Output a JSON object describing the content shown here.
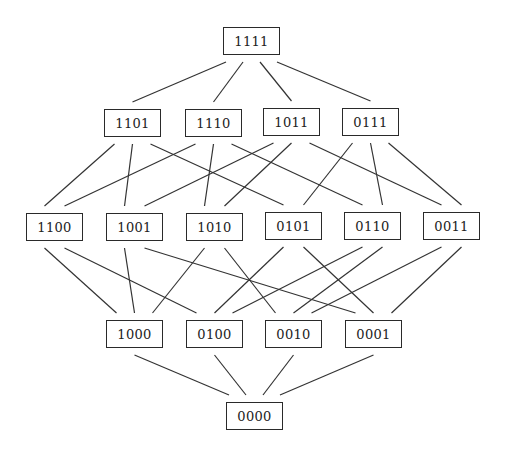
{
  "diagram": {
    "title": "",
    "type": "hasse-diagram",
    "line_color": "#333333",
    "box_width": 57,
    "box_height": 28,
    "levels": [
      {
        "nodes": [
          {
            "label": "1111",
            "x": 223,
            "y": 27
          }
        ]
      },
      {
        "nodes": [
          {
            "label": "1101",
            "x": 104,
            "y": 109
          },
          {
            "label": "1110",
            "x": 185,
            "y": 109
          },
          {
            "label": "1011",
            "x": 263,
            "y": 108
          },
          {
            "label": "0111",
            "x": 342,
            "y": 108
          }
        ]
      },
      {
        "nodes": [
          {
            "label": "1100",
            "x": 26,
            "y": 213
          },
          {
            "label": "1001",
            "x": 106,
            "y": 213
          },
          {
            "label": "1010",
            "x": 186,
            "y": 213
          },
          {
            "label": "0101",
            "x": 265,
            "y": 212
          },
          {
            "label": "0110",
            "x": 344,
            "y": 212
          },
          {
            "label": "0011",
            "x": 423,
            "y": 212
          }
        ]
      },
      {
        "nodes": [
          {
            "label": "1000",
            "x": 106,
            "y": 320
          },
          {
            "label": "0100",
            "x": 186,
            "y": 320
          },
          {
            "label": "0010",
            "x": 265,
            "y": 320
          },
          {
            "label": "0001",
            "x": 345,
            "y": 320
          }
        ]
      },
      {
        "nodes": [
          {
            "label": "0000",
            "x": 226,
            "y": 402
          }
        ]
      }
    ],
    "edges": [
      [
        "1111",
        "1101"
      ],
      [
        "1111",
        "1110"
      ],
      [
        "1111",
        "1011"
      ],
      [
        "1111",
        "0111"
      ],
      [
        "1101",
        "1100"
      ],
      [
        "1101",
        "1001"
      ],
      [
        "1101",
        "0101"
      ],
      [
        "1110",
        "1100"
      ],
      [
        "1110",
        "1010"
      ],
      [
        "1110",
        "0110"
      ],
      [
        "1011",
        "1001"
      ],
      [
        "1011",
        "1010"
      ],
      [
        "1011",
        "0011"
      ],
      [
        "0111",
        "0101"
      ],
      [
        "0111",
        "0110"
      ],
      [
        "0111",
        "0011"
      ],
      [
        "1100",
        "1000"
      ],
      [
        "1100",
        "0100"
      ],
      [
        "1001",
        "1000"
      ],
      [
        "1001",
        "0001"
      ],
      [
        "1010",
        "1000"
      ],
      [
        "1010",
        "0010"
      ],
      [
        "0101",
        "0100"
      ],
      [
        "0101",
        "0001"
      ],
      [
        "0110",
        "0100"
      ],
      [
        "0110",
        "0010"
      ],
      [
        "0011",
        "0010"
      ],
      [
        "0011",
        "0001"
      ],
      [
        "1000",
        "0000"
      ],
      [
        "0100",
        "0000"
      ],
      [
        "0010",
        "0000"
      ],
      [
        "0001",
        "0000"
      ]
    ]
  }
}
